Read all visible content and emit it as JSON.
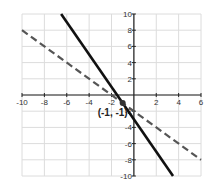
{
  "chart_data": {
    "type": "line",
    "title": "",
    "xlabel": "",
    "ylabel": "",
    "xlim": [
      -10,
      6
    ],
    "ylim": [
      -10,
      10
    ],
    "grid": true,
    "grid_step": 2,
    "x_ticks": [
      -10,
      -8,
      -6,
      -4,
      -2,
      2,
      4,
      6
    ],
    "x_tick_labels": [
      "-10",
      "-8",
      "-6",
      "-4",
      "-2",
      "2",
      "4",
      "6"
    ],
    "y_ticks": [
      10,
      8,
      6,
      4,
      2,
      -2,
      -4,
      -6,
      -8,
      -10
    ],
    "y_tick_labels": [
      "10",
      "8",
      "6",
      "4",
      "2",
      "-2",
      "-4",
      "-6",
      "-8",
      "-10"
    ],
    "series": [
      {
        "name": "solid-line",
        "style": "solid",
        "color": "#111111",
        "equation": "y = -2x - 3",
        "x": [
          -6.5,
          3.5
        ],
        "y": [
          10,
          -10
        ]
      },
      {
        "name": "dashed-line",
        "style": "dashed",
        "color": "#555555",
        "equation": "y = -x - 2",
        "x": [
          -10,
          6
        ],
        "y": [
          8,
          -8
        ]
      }
    ],
    "points": [
      {
        "x": -1,
        "y": -1,
        "label": "(-1, -1)"
      }
    ]
  }
}
